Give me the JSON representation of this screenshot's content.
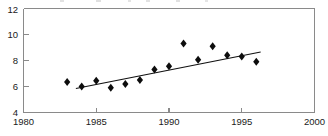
{
  "chart_data": {
    "type": "scatter",
    "title": "",
    "subtitle": "",
    "xlabel": "",
    "ylabel": "",
    "xlim": [
      1980,
      2000
    ],
    "ylim": [
      4,
      12
    ],
    "xticks": [
      1980,
      1985,
      1990,
      1995,
      2000
    ],
    "xtick_labels": [
      "1980",
      "1985",
      "1990",
      "1995",
      "2000"
    ],
    "yticks": [
      4,
      6,
      8,
      10,
      12
    ],
    "ytick_labels": [
      "4",
      "6",
      "8",
      "10",
      "12"
    ],
    "grid": false,
    "legend": null,
    "marker": "diamond",
    "marker_color": "#0d0d0d",
    "trendline_color": "#111111",
    "axis_color": "#8a8a8a",
    "x": [
      1983,
      1984,
      1985,
      1986,
      1987,
      1988,
      1989,
      1990,
      1991,
      1992,
      1993,
      1994,
      1995,
      1996
    ],
    "values": [
      6.35,
      6.0,
      6.45,
      5.9,
      6.2,
      6.5,
      7.3,
      7.55,
      9.3,
      8.05,
      9.1,
      8.4,
      8.3,
      7.9
    ],
    "series": [
      {
        "name": "observations",
        "x": [
          1983,
          1984,
          1985,
          1986,
          1987,
          1988,
          1989,
          1990,
          1991,
          1992,
          1993,
          1994,
          1995,
          1996
        ],
        "values": [
          6.35,
          6.0,
          6.45,
          5.9,
          6.2,
          6.5,
          7.3,
          7.55,
          9.3,
          8.05,
          9.1,
          8.4,
          8.3,
          7.9
        ]
      },
      {
        "name": "trend",
        "type": "line",
        "x": [
          1983.6,
          1996.3
        ],
        "values": [
          5.85,
          8.65
        ]
      }
    ],
    "annotations": []
  },
  "axes": {
    "x_axis_name": "year-axis",
    "y_axis_name": "value-axis"
  }
}
